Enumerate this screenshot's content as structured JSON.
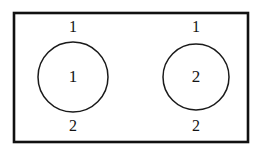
{
  "diagram": {
    "title": "",
    "colors": {
      "background": "#ffffff",
      "stroke": "#111111",
      "circle_stroke": "#1a1a1a",
      "text": "#141414",
      "fill": "#ffffff"
    },
    "boundary": {
      "name": "outer-boundary-rectangle",
      "x": 14,
      "y": 13,
      "width": 234,
      "height": 129
    },
    "nodes": [
      {
        "id": "node-left",
        "label": "1",
        "cx": 73,
        "cy": 77,
        "r": 35,
        "ports": [
          {
            "id": "node-left-top-port",
            "label": "1",
            "x": 73,
            "y": 28
          },
          {
            "id": "node-left-bottom-port",
            "label": "2",
            "x": 73,
            "y": 127
          }
        ]
      },
      {
        "id": "node-right",
        "label": "2",
        "cx": 196,
        "cy": 77,
        "r": 33,
        "ports": [
          {
            "id": "node-right-top-port",
            "label": "1",
            "x": 196,
            "y": 28
          },
          {
            "id": "node-right-bottom-port",
            "label": "2",
            "x": 196,
            "y": 127
          }
        ]
      }
    ]
  }
}
